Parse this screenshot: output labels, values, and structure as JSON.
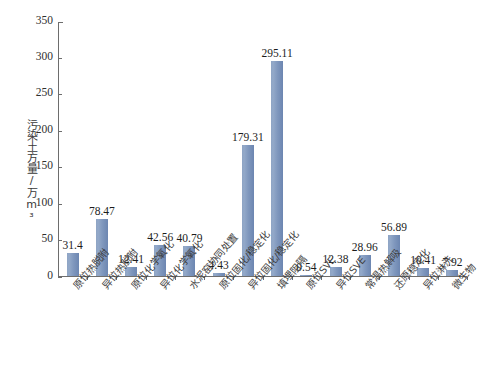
{
  "chart_data": {
    "type": "bar",
    "title": "",
    "xlabel": "",
    "ylabel": "污染土方量/万m³",
    "ylim": [
      0,
      350
    ],
    "ytick_values": [
      0,
      50,
      100,
      150,
      200,
      250,
      300,
      350
    ],
    "ytick_labels": [
      "0",
      "50",
      "100",
      "150",
      "200",
      "250",
      "300",
      "350"
    ],
    "grid": false,
    "legend": false,
    "bar_color": "#7f97bd",
    "axis_color": "#6d6d6d",
    "categories": [
      "原位热脱附",
      "异位热脱附",
      "原位化学氧化",
      "异位化学氧化",
      "水泥窑协同处置",
      "原位固化/稳定化",
      "异位固化/稳定化",
      "填埋阻隔",
      "原位SVE",
      "异位SVE",
      "常温热解吸",
      "还原稳定化",
      "异位淋洗",
      "微生物"
    ],
    "values": [
      31.4,
      78.47,
      12.41,
      42.56,
      40.79,
      4.43,
      179.31,
      295.11,
      0.54,
      12.38,
      28.96,
      56.89,
      10.41,
      7.92
    ],
    "value_labels": [
      "31.4",
      "78.47",
      "12.41",
      "42.56",
      "40.79",
      "4.43",
      "179.31",
      "295.11",
      "0.54",
      "12.38",
      "28.96",
      "56.89",
      "10.41",
      "7.92"
    ]
  }
}
